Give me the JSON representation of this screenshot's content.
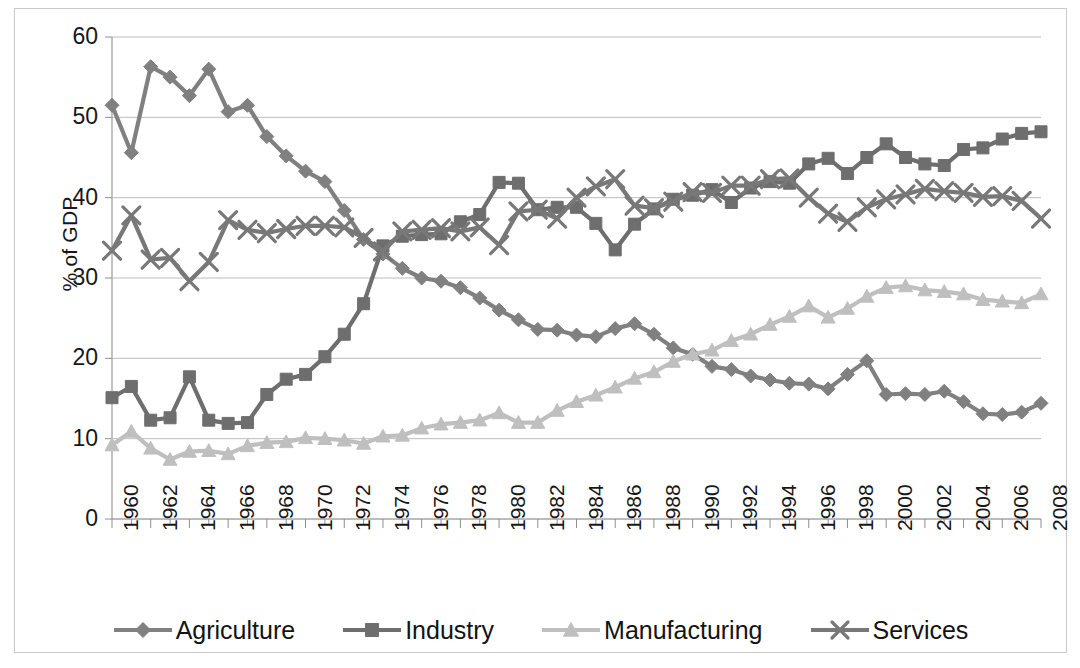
{
  "chart_data": {
    "type": "line",
    "title": "",
    "xlabel": "",
    "ylabel": "% of GDP",
    "ylim": [
      0,
      60
    ],
    "ytick_step": 10,
    "yticks": [
      "0",
      "10",
      "20",
      "30",
      "40",
      "50",
      "60"
    ],
    "grid": true,
    "grid_axis": "y",
    "legend_position": "bottom",
    "xlim": [
      1960,
      2008
    ],
    "xtick_step": 2,
    "x": [
      1960,
      1961,
      1962,
      1963,
      1964,
      1965,
      1966,
      1967,
      1968,
      1969,
      1970,
      1971,
      1972,
      1973,
      1974,
      1975,
      1976,
      1977,
      1978,
      1979,
      1980,
      1981,
      1982,
      1983,
      1984,
      1985,
      1986,
      1987,
      1988,
      1989,
      1990,
      1991,
      1992,
      1993,
      1994,
      1995,
      1996,
      1997,
      1998,
      1999,
      2000,
      2001,
      2002,
      2003,
      2004,
      2005,
      2006,
      2007,
      2008
    ],
    "xticks": [
      "1960",
      "1962",
      "1964",
      "1966",
      "1968",
      "1970",
      "1972",
      "1974",
      "1976",
      "1978",
      "1980",
      "1982",
      "1984",
      "1986",
      "1988",
      "1990",
      "1992",
      "1994",
      "1996",
      "1998",
      "2000",
      "2002",
      "2004",
      "2006",
      "2008"
    ],
    "series": [
      {
        "name": "Agriculture",
        "marker": "diamond",
        "color": "#808080",
        "values": [
          51.5,
          45.6,
          56.3,
          55.0,
          52.7,
          56.0,
          50.7,
          51.5,
          47.6,
          45.2,
          43.3,
          42.0,
          38.4,
          34.8,
          33.0,
          31.2,
          30.0,
          29.6,
          28.8,
          27.5,
          26.0,
          24.8,
          23.6,
          23.5,
          22.9,
          22.7,
          23.7,
          24.3,
          23.0,
          21.3,
          20.5,
          19.0,
          18.6,
          17.8,
          17.3,
          16.9,
          16.8,
          16.2,
          18.0,
          19.7,
          15.5,
          15.6,
          15.5,
          15.9,
          14.6,
          13.1,
          13.0,
          13.3,
          14.4
        ]
      },
      {
        "name": "Industry",
        "marker": "square",
        "color": "#6e6e6e",
        "values": [
          15.1,
          16.5,
          12.3,
          12.6,
          17.7,
          12.3,
          11.9,
          12.0,
          15.5,
          17.4,
          18.0,
          20.2,
          23.0,
          26.8,
          34.0,
          35.2,
          35.4,
          35.5,
          37.0,
          37.9,
          41.9,
          41.8,
          38.5,
          38.8,
          38.8,
          36.8,
          33.5,
          36.7,
          38.6,
          39.8,
          40.3,
          41.0,
          39.4,
          41.2,
          42.0,
          41.8,
          44.2,
          44.9,
          43.0,
          45.0,
          46.7,
          45.0,
          44.2,
          44.0,
          46.0,
          46.2,
          47.3,
          48.0,
          48.2
        ]
      },
      {
        "name": "Manufacturing",
        "marker": "triangle",
        "color": "#bfbfbf",
        "values": [
          9.2,
          10.9,
          8.8,
          7.4,
          8.4,
          8.5,
          8.1,
          9.1,
          9.5,
          9.6,
          10.1,
          10.0,
          9.8,
          9.4,
          10.3,
          10.4,
          11.3,
          11.8,
          12.0,
          12.3,
          13.2,
          12.0,
          12.0,
          13.5,
          14.6,
          15.4,
          16.4,
          17.5,
          18.3,
          19.6,
          20.5,
          21.0,
          22.2,
          23.0,
          24.2,
          25.2,
          26.5,
          25.1,
          26.2,
          27.7,
          28.8,
          29.0,
          28.5,
          28.3,
          28.0,
          27.3,
          27.1,
          26.9,
          28.0
        ]
      },
      {
        "name": "Services",
        "marker": "cross",
        "color": "#787878",
        "values": [
          33.4,
          37.8,
          32.3,
          32.5,
          29.6,
          32.0,
          37.2,
          36.0,
          35.6,
          36.1,
          36.5,
          36.5,
          36.3,
          35.0,
          33.3,
          35.8,
          36.0,
          36.2,
          35.8,
          36.3,
          34.1,
          38.3,
          38.5,
          37.4,
          40.0,
          41.4,
          42.3,
          39.0,
          38.7,
          39.5,
          40.7,
          40.6,
          41.5,
          41.5,
          42.3,
          42.4,
          40.0,
          38.0,
          37.0,
          38.8,
          39.8,
          40.4,
          41.1,
          40.8,
          40.6,
          40.1,
          40.2,
          39.6,
          37.4
        ]
      }
    ]
  },
  "legend": {
    "items": [
      {
        "label": "Agriculture",
        "marker": "diamond",
        "color": "#808080"
      },
      {
        "label": "Industry",
        "marker": "square",
        "color": "#6e6e6e"
      },
      {
        "label": "Manufacturing",
        "marker": "triangle",
        "color": "#bfbfbf"
      },
      {
        "label": "Services",
        "marker": "cross",
        "color": "#787878"
      }
    ]
  }
}
